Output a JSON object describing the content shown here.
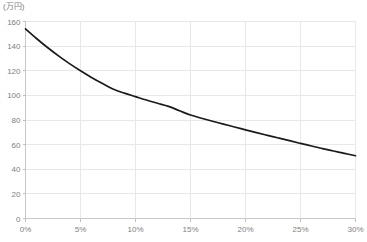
{
  "chart_data": {
    "type": "line",
    "title": "",
    "subtitle": "",
    "xlabel": "",
    "ylabel": "",
    "y_unit_label": "(万円)",
    "x": [
      0,
      5,
      10,
      15,
      20,
      25,
      30
    ],
    "x_tick_labels": [
      "0%",
      "5%",
      "10%",
      "15%",
      "20%",
      "25%",
      "30%"
    ],
    "y_tick_values": [
      0,
      20,
      40,
      60,
      80,
      100,
      120,
      140,
      160
    ],
    "y_tick_labels": [
      "0",
      "20",
      "40",
      "60",
      "80",
      "100",
      "120",
      "140",
      "160"
    ],
    "xlim": [
      0,
      30
    ],
    "ylim": [
      0,
      160
    ],
    "grid": true,
    "legend": false,
    "legend_position": "none",
    "series": [
      {
        "name": "",
        "color": "#1a1a1a",
        "values": [
          154,
          120,
          99,
          84,
          72,
          61,
          51
        ],
        "dense_x": [
          0,
          1,
          2,
          3,
          4,
          5,
          6,
          7,
          8,
          9,
          10,
          11,
          12,
          13,
          14,
          15,
          16,
          17,
          18,
          19,
          20,
          21,
          22,
          23,
          24,
          25,
          26,
          27,
          28,
          29,
          30
        ],
        "dense_values": [
          154,
          146.2,
          138.9,
          132.1,
          125.8,
          120,
          114.6,
          109.6,
          105.0,
          101.8,
          99,
          96.2,
          93.6,
          91.1,
          87.5,
          84,
          81.4,
          79.0,
          76.7,
          74.3,
          72,
          69.7,
          67.5,
          65.4,
          63.2,
          61,
          58.9,
          56.8,
          54.8,
          52.9,
          51
        ]
      }
    ],
    "colors": {
      "series_line": "#1a1a1a",
      "grid": "#e8e8e8",
      "axis": "#c8c8c8",
      "tick_text": "#808080",
      "background": "#ffffff"
    }
  }
}
